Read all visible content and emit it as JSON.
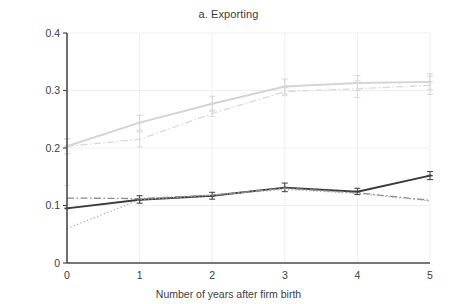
{
  "chart_data": {
    "type": "line",
    "title": "a. Exporting",
    "xlabel": "Number of years after firm birth",
    "ylabel": "Probability that the firm exports directly",
    "x": [
      0,
      1,
      2,
      3,
      4,
      5
    ],
    "xticklabels": [
      "0",
      "1",
      "2",
      "3",
      "4",
      "5"
    ],
    "yticklabels": [
      "0",
      "0.1",
      "0.2",
      "0.3",
      "0.4"
    ],
    "yticks": [
      0,
      0.1,
      0.2,
      0.3,
      0.4
    ],
    "xlim": [
      0,
      5
    ],
    "ylim": [
      0,
      0.4
    ],
    "grid": true,
    "grid_color": "#efefef",
    "legend": "none",
    "series": [
      {
        "name": "light-gray-solid-upper",
        "style": "solid",
        "color": "#d4d4d4",
        "values": [
          0.203,
          0.244,
          0.277,
          0.307,
          0.313,
          0.315
        ],
        "err_low": [
          0.19,
          0.231,
          0.264,
          0.294,
          0.3,
          0.301
        ],
        "err_high": [
          0.216,
          0.257,
          0.29,
          0.32,
          0.326,
          0.329
        ]
      },
      {
        "name": "light-gray-dashdot-upper",
        "style": "dashdot",
        "color": "#d9d9d9",
        "values": [
          0.203,
          0.215,
          0.26,
          0.298,
          0.303,
          0.309
        ],
        "err_low": [
          0.135,
          0.202,
          0.255,
          0.291,
          0.288,
          0.293
        ],
        "err_high": [
          0.216,
          0.228,
          0.266,
          0.305,
          0.317,
          0.325
        ]
      },
      {
        "name": "dark-gray-solid-lower",
        "style": "solid",
        "color": "#3a3a3a",
        "values": [
          0.095,
          0.11,
          0.117,
          0.131,
          0.124,
          0.152
        ],
        "err_low": [
          0.095,
          0.104,
          0.111,
          0.124,
          0.119,
          0.145
        ],
        "err_high": [
          0.095,
          0.117,
          0.123,
          0.139,
          0.13,
          0.159
        ]
      },
      {
        "name": "gray-dashdot-lower",
        "style": "dashdot",
        "color": "#8c8c8c",
        "values": [
          0.113,
          0.112,
          0.118,
          0.13,
          0.122,
          0.109
        ],
        "err_low": [
          0.113,
          0.112,
          0.118,
          0.13,
          0.122,
          0.109
        ],
        "err_high": [
          0.113,
          0.112,
          0.118,
          0.13,
          0.122,
          0.109
        ]
      },
      {
        "name": "gray-dotted-lower",
        "style": "dotted",
        "color": "#a8a8a8",
        "values": [
          0.06,
          0.11,
          0.118,
          0.128,
          0.121,
          0.108
        ],
        "err_low": [
          0.06,
          0.11,
          0.118,
          0.128,
          0.121,
          0.108
        ],
        "err_high": [
          0.06,
          0.11,
          0.118,
          0.128,
          0.121,
          0.108
        ]
      }
    ]
  },
  "axes": {
    "axis_color": "#4a4a4a"
  }
}
